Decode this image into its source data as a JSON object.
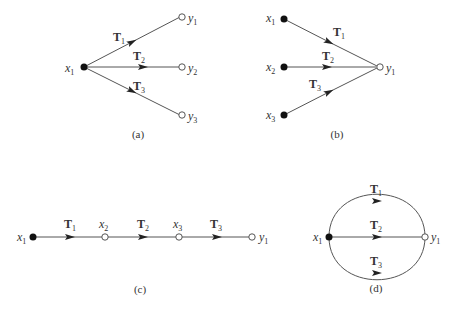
{
  "colors": {
    "line": "#555555",
    "node_filled": "#111111",
    "node_open_stroke": "#555555",
    "text": "#333333"
  },
  "diagrams": {
    "a": {
      "caption": "(a)",
      "source_nodes": [
        {
          "name": "x",
          "sub": "1"
        }
      ],
      "sink_nodes": [
        {
          "name": "y",
          "sub": "1"
        },
        {
          "name": "y",
          "sub": "2"
        },
        {
          "name": "y",
          "sub": "3"
        }
      ],
      "edges": [
        {
          "label": "T",
          "sub": "1"
        },
        {
          "label": "T",
          "sub": "2"
        },
        {
          "label": "T",
          "sub": "3"
        }
      ]
    },
    "b": {
      "caption": "(b)",
      "source_nodes": [
        {
          "name": "x",
          "sub": "1"
        },
        {
          "name": "x",
          "sub": "2"
        },
        {
          "name": "x",
          "sub": "3"
        }
      ],
      "sink_nodes": [
        {
          "name": "y",
          "sub": "1"
        }
      ],
      "edges": [
        {
          "label": "T",
          "sub": "1"
        },
        {
          "label": "T",
          "sub": "2"
        },
        {
          "label": "T",
          "sub": "3"
        }
      ]
    },
    "c": {
      "caption": "(c)",
      "nodes": [
        {
          "name": "x",
          "sub": "1"
        },
        {
          "name": "x",
          "sub": "2"
        },
        {
          "name": "x",
          "sub": "3"
        },
        {
          "name": "y",
          "sub": "1"
        }
      ],
      "edges": [
        {
          "label": "T",
          "sub": "1"
        },
        {
          "label": "T",
          "sub": "2"
        },
        {
          "label": "T",
          "sub": "3"
        }
      ]
    },
    "d": {
      "caption": "(d)",
      "source_nodes": [
        {
          "name": "x",
          "sub": "1"
        }
      ],
      "sink_nodes": [
        {
          "name": "y",
          "sub": "1"
        }
      ],
      "edges": [
        {
          "label": "T",
          "sub": "1"
        },
        {
          "label": "T",
          "sub": "2"
        },
        {
          "label": "T",
          "sub": "3"
        }
      ]
    }
  }
}
